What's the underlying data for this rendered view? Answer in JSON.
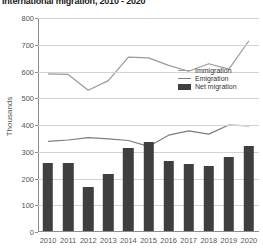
{
  "chart_data": {
    "type": "bar",
    "title": "International migration, 2010 - 2020",
    "xlabel": "",
    "ylabel": "Thousands",
    "ylim": [
      0,
      800
    ],
    "ytick_values": [
      0,
      100,
      200,
      300,
      400,
      500,
      600,
      700,
      800
    ],
    "ytick_labels": [
      "0",
      "100",
      "200",
      "300",
      "400",
      "500",
      "600",
      "700",
      "800"
    ],
    "grid": true,
    "legend_position": "upper right",
    "categories": [
      "2010",
      "2011",
      "2012",
      "2013",
      "2014",
      "2015",
      "2016",
      "2017",
      "2018",
      "2019",
      "2020"
    ],
    "series": [
      {
        "name": "Immigration",
        "type": "line",
        "color": "#9a9a9a",
        "values": [
          591,
          589,
          530,
          566,
          654,
          651,
          623,
          601,
          629,
          609,
          715
        ]
      },
      {
        "name": "Emigration",
        "type": "line",
        "color": "#7d7d7d",
        "values": [
          339,
          344,
          353,
          348,
          342,
          320,
          362,
          378,
          366,
          400,
          397
        ]
      },
      {
        "name": "Net migration",
        "type": "bar",
        "color": "#3f3f3f",
        "values": [
          256,
          254,
          163,
          212,
          312,
          331,
          263,
          251,
          242,
          275,
          318
        ]
      }
    ]
  },
  "legend": {
    "items": [
      {
        "label": "Immigration"
      },
      {
        "label": "Emigration"
      },
      {
        "label": "Net migration"
      }
    ]
  }
}
